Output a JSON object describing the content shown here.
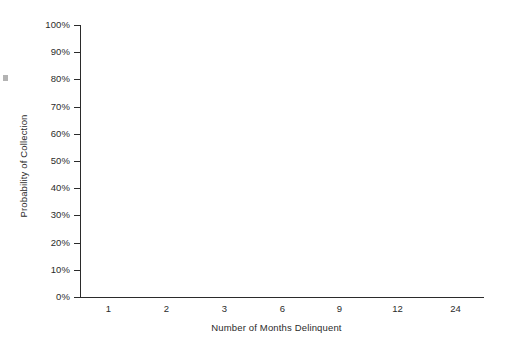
{
  "chart_data": {
    "type": "bar",
    "title": "",
    "subtitle": "",
    "xlabel": "Number of Months Delinquent",
    "ylabel": "Probability of Collection",
    "categories": [
      "1",
      "2",
      "3",
      "6",
      "9",
      "12",
      "24"
    ],
    "values": [
      93.8,
      85.2,
      73.6,
      57.8,
      42.8,
      23.6,
      13.6
    ],
    "value_labels": [
      "93.8%",
      "85.2%",
      "73.6%",
      "57.8%",
      "42.8%",
      "23.6%",
      "13.6%"
    ],
    "ylim": [
      0,
      100
    ],
    "ytick_values": [
      0,
      10,
      20,
      30,
      40,
      50,
      60,
      70,
      80,
      90,
      100
    ],
    "ytick_labels": [
      "0%",
      "10%",
      "20%",
      "30%",
      "40%",
      "50%",
      "60%",
      "70%",
      "80%",
      "90%",
      "100%"
    ],
    "grid": false,
    "legend": false,
    "legend_position": "none",
    "series": [
      {
        "name": "Probability of Collection",
        "values": [
          93.8,
          85.2,
          73.6,
          57.8,
          42.8,
          23.6,
          13.6
        ]
      }
    ],
    "bar_style": {
      "fill_color": "#e3e3e3",
      "edge_color": "#1f1f1f",
      "shadow_color": "#0d0d0d",
      "three_d_shadow": true
    },
    "axis_color": "#2b2b2b",
    "background_color": "#ffffff"
  }
}
